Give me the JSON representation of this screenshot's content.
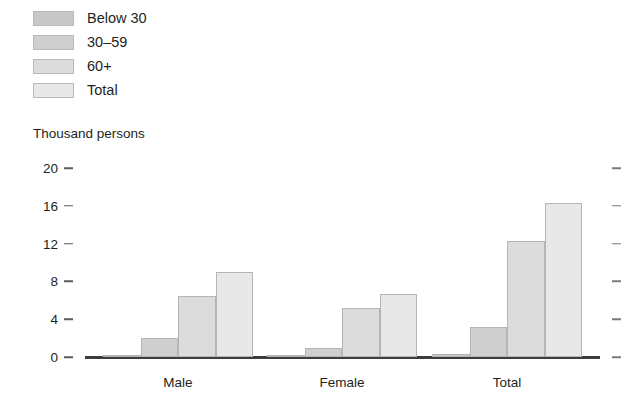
{
  "chart_data": {
    "type": "bar",
    "title": "",
    "subtitle": "",
    "xlabel": "",
    "ylabel": "Thousand persons",
    "categories": [
      "Male",
      "Female",
      "Total"
    ],
    "series": [
      {
        "name": "Below 30",
        "values": [
          0.1,
          0.1,
          0.35
        ],
        "color": "#c8c8c8"
      },
      {
        "name": "30–59",
        "values": [
          2.0,
          1.0,
          3.2
        ],
        "color": "#cfcfcf"
      },
      {
        "name": "60+",
        "values": [
          6.5,
          5.2,
          12.3
        ],
        "color": "#dcdcdc"
      },
      {
        "name": "Total",
        "values": [
          9.0,
          6.7,
          16.3
        ],
        "color": "#e8e8e8"
      }
    ],
    "ylim": [
      0,
      20
    ],
    "yticks": [
      0,
      4,
      8,
      12,
      16,
      20
    ],
    "ytick_labels": [
      "0",
      "4",
      "8",
      "12",
      "16",
      "20"
    ],
    "grid": false,
    "legend_position": "top-left",
    "right_axis_ticks": true,
    "right_axis_labels": []
  },
  "legend": {
    "items": [
      {
        "label": "Below 30",
        "swatch": "#c8c8c8"
      },
      {
        "label": "30–59",
        "swatch": "#cfcfcf"
      },
      {
        "label": "60+",
        "swatch": "#dcdcdc"
      },
      {
        "label": "Total",
        "swatch": "#e8e8e8"
      }
    ]
  },
  "axis": {
    "y_title": "Thousand persons"
  }
}
